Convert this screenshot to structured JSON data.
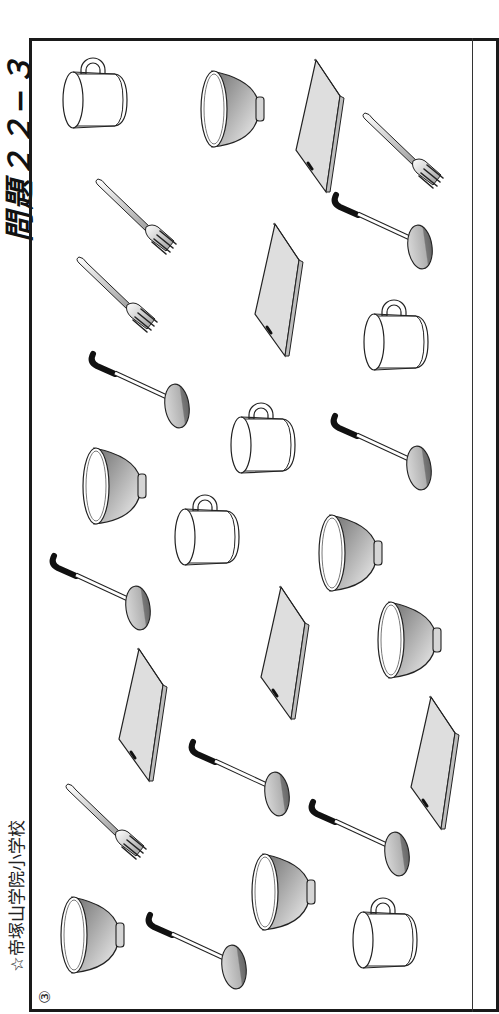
{
  "title": "問題２２−３",
  "school": "☆帝塚山学院小学校",
  "problem_marker": "③",
  "colors": {
    "frame": "#1a1a1a",
    "ink": "#222222",
    "board_fill": "#dcdcdc",
    "bowl_shade": "#8a8a8a",
    "ladle_handle": "#111111"
  },
  "items": [
    {
      "type": "mug",
      "x": 95,
      "y": 100,
      "rot": 0
    },
    {
      "type": "bowl",
      "x": 232,
      "y": 109,
      "rot": 0
    },
    {
      "type": "board",
      "x": 318,
      "y": 126,
      "rot": 0
    },
    {
      "type": "fork",
      "x": 403,
      "y": 151,
      "rot": 0
    },
    {
      "type": "fork",
      "x": 136,
      "y": 217,
      "rot": 0
    },
    {
      "type": "ladle",
      "x": 382,
      "y": 231,
      "rot": 0
    },
    {
      "type": "fork",
      "x": 117,
      "y": 295,
      "rot": 0
    },
    {
      "type": "board",
      "x": 277,
      "y": 290,
      "rot": 0
    },
    {
      "type": "mug",
      "x": 396,
      "y": 342,
      "rot": 0
    },
    {
      "type": "ladle",
      "x": 139,
      "y": 390,
      "rot": 0
    },
    {
      "type": "mug",
      "x": 263,
      "y": 445,
      "rot": 0
    },
    {
      "type": "ladle",
      "x": 381,
      "y": 452,
      "rot": 0
    },
    {
      "type": "bowl",
      "x": 114,
      "y": 486,
      "rot": 0
    },
    {
      "type": "mug",
      "x": 207,
      "y": 537,
      "rot": 0
    },
    {
      "type": "bowl",
      "x": 350,
      "y": 553,
      "rot": 0
    },
    {
      "type": "ladle",
      "x": 100,
      "y": 592,
      "rot": 0
    },
    {
      "type": "board",
      "x": 283,
      "y": 653,
      "rot": 0
    },
    {
      "type": "bowl",
      "x": 409,
      "y": 640,
      "rot": 0
    },
    {
      "type": "board",
      "x": 141,
      "y": 715,
      "rot": 0
    },
    {
      "type": "ladle",
      "x": 239,
      "y": 778,
      "rot": 0
    },
    {
      "type": "board",
      "x": 433,
      "y": 763,
      "rot": 0
    },
    {
      "type": "fork",
      "x": 106,
      "y": 822,
      "rot": 0
    },
    {
      "type": "ladle",
      "x": 359,
      "y": 838,
      "rot": 0
    },
    {
      "type": "bowl",
      "x": 283,
      "y": 892,
      "rot": 0
    },
    {
      "type": "bowl",
      "x": 92,
      "y": 935,
      "rot": 0
    },
    {
      "type": "ladle",
      "x": 196,
      "y": 951,
      "rot": 0
    },
    {
      "type": "mug",
      "x": 385,
      "y": 940,
      "rot": 0
    }
  ]
}
